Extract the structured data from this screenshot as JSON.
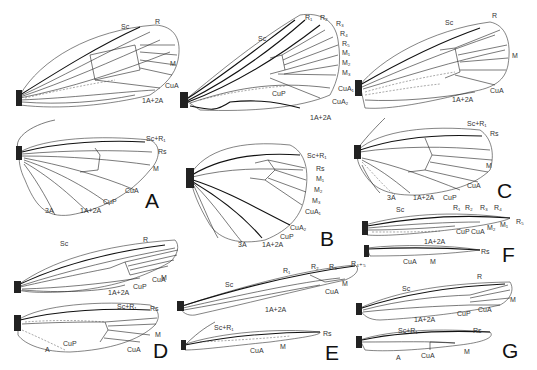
{
  "figure": {
    "panels": [
      {
        "id": "A",
        "forewing": [
          "Sc",
          "R",
          "M",
          "CuA",
          "1A+2A"
        ],
        "hindwing": [
          "Sc+R1",
          "Rs",
          "M",
          "CuA",
          "CuP",
          "1A+2A",
          "3A"
        ]
      },
      {
        "id": "B",
        "forewing": [
          "Sc",
          "R1",
          "R2",
          "R3",
          "R4",
          "R5",
          "M1",
          "M2",
          "M3",
          "CuA1",
          "CuA2",
          "CuP",
          "1A+2A"
        ],
        "hindwing": [
          "Sc+R1",
          "Rs",
          "M1",
          "M2",
          "M3",
          "CuA1",
          "CuA2",
          "CuP",
          "1A+2A",
          "3A"
        ]
      },
      {
        "id": "C",
        "forewing": [
          "Sc",
          "R",
          "M",
          "CuA",
          "1A+2A"
        ],
        "hindwing": [
          "Sc+R1",
          "Rs",
          "M",
          "CuA",
          "CuP",
          "1A+2A",
          "3A"
        ]
      },
      {
        "id": "D",
        "forewing": [
          "Sc",
          "R",
          "M",
          "CuA",
          "CuP",
          "1A+2A"
        ],
        "hindwing": [
          "Sc+R1",
          "Rs",
          "M",
          "CuA",
          "CuP",
          "A"
        ]
      },
      {
        "id": "E",
        "forewing": [
          "Sc",
          "R1",
          "R2",
          "R3",
          "R4+5",
          "M",
          "CuA",
          "1A+2A"
        ],
        "hindwing": [
          "Sc+R1",
          "Rs",
          "CuA",
          "M"
        ]
      },
      {
        "id": "F",
        "forewing": [
          "Sc",
          "R1",
          "R2",
          "R3",
          "R4",
          "R5",
          "M1",
          "M2",
          "CuA",
          "CuP",
          "1A+2A"
        ],
        "hindwing": [
          "Rs",
          "CuA",
          "M"
        ]
      },
      {
        "id": "G",
        "forewing": [
          "Sc",
          "R",
          "M",
          "CuA",
          "CuP",
          "1A+2A"
        ],
        "hindwing": [
          "Sc+R1",
          "Rs",
          "M",
          "CuA",
          "A"
        ]
      }
    ]
  },
  "labels": {
    "A": {
      "letter": "A",
      "fw_sc": "Sc",
      "fw_r": "R",
      "fw_m": "M",
      "fw_cua": "CuA",
      "fw_a": "1A+2A",
      "hw_scr1": "Sc+R₁",
      "hw_rs": "Rs",
      "hw_m": "M",
      "hw_cua": "CuA",
      "hw_cup": "CuP",
      "hw_a": "1A+2A",
      "hw_3a": "3A"
    },
    "B": {
      "letter": "B",
      "fw_sc": "Sc",
      "fw_r1": "R₁",
      "fw_r2": "R₂",
      "fw_r3": "R₃",
      "fw_r4": "R₄",
      "fw_r5": "R₅",
      "fw_m1": "M₁",
      "fw_m2": "M₂",
      "fw_m3": "M₃",
      "fw_cua1": "CuA₁",
      "fw_cua2": "CuA₂",
      "fw_cup": "CuP",
      "fw_a": "1A+2A",
      "hw_scr1": "Sc+R₁",
      "hw_rs": "Rs",
      "hw_m1": "M₁",
      "hw_m2": "M₂",
      "hw_m3": "M₃",
      "hw_cua1": "CuA₁",
      "hw_cua2": "CuA₂",
      "hw_cup": "CuP",
      "hw_a": "1A+2A",
      "hw_3a": "3A"
    },
    "C": {
      "letter": "C",
      "fw_sc": "Sc",
      "fw_r": "R",
      "fw_m": "M",
      "fw_cua": "CuA",
      "fw_a": "1A+2A",
      "hw_scr1": "Sc+R₁",
      "hw_rs": "Rs",
      "hw_m": "M",
      "hw_cua": "CuA",
      "hw_cup": "CuP",
      "hw_a": "1A+2A",
      "hw_3a": "3A"
    },
    "D": {
      "letter": "D",
      "fw_sc": "Sc",
      "fw_r": "R",
      "fw_m": "M",
      "fw_cua": "CuA",
      "fw_cup": "CuP",
      "fw_a": "1A+2A",
      "hw_scr1": "Sc+R₁",
      "hw_rs": "Rs",
      "hw_m": "M",
      "hw_cua": "CuA",
      "hw_cup": "CuP",
      "hw_a": "A"
    },
    "E": {
      "letter": "E",
      "fw_sc": "Sc",
      "fw_r1": "R₁",
      "fw_r2": "R₂",
      "fw_r3": "R₃",
      "fw_r45": "R₄₊₅",
      "fw_m": "M",
      "fw_cua": "CuA",
      "fw_a": "1A+2A",
      "hw_scr1": "Sc+R₁",
      "hw_rs": "Rs",
      "hw_cua": "CuA",
      "hw_m": "M"
    },
    "F": {
      "letter": "F",
      "fw_sc": "Sc",
      "fw_r1": "R₁",
      "fw_r2": "R₂",
      "fw_r3": "R₃",
      "fw_r4": "R₄",
      "fw_r5": "R₅",
      "fw_m1": "M₁",
      "fw_m2": "M₂",
      "fw_cua": "CuA",
      "fw_cup": "CuP",
      "fw_a": "1A+2A",
      "hw_rs": "Rs",
      "hw_cua": "CuA",
      "hw_m": "M"
    },
    "G": {
      "letter": "G",
      "fw_sc": "Sc",
      "fw_r": "R",
      "fw_m": "M",
      "fw_cua": "CuA",
      "fw_cup": "CuP",
      "fw_a": "1A+2A",
      "hw_scr1": "Sc+R₁",
      "hw_rs": "Rs",
      "hw_m": "M",
      "hw_cua": "CuA",
      "hw_a": "A"
    }
  }
}
